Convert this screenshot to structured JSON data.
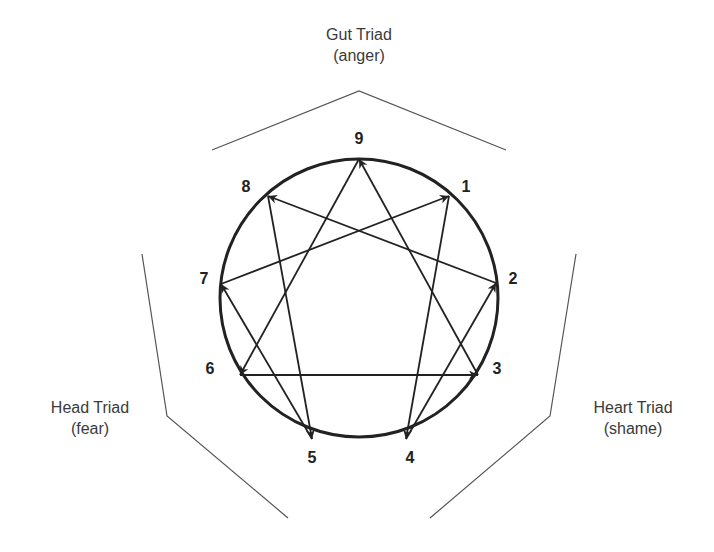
{
  "diagram": {
    "triads": [
      {
        "name": "Gut Triad",
        "emotion": "(anger)"
      },
      {
        "name": "Head Triad",
        "emotion": "(fear)"
      },
      {
        "name": "Heart Triad",
        "emotion": "(shame)"
      }
    ],
    "points": [
      "1",
      "2",
      "3",
      "4",
      "5",
      "6",
      "7",
      "8",
      "9"
    ],
    "arrows": [
      {
        "from": "9",
        "to": "6"
      },
      {
        "from": "6",
        "to": "3"
      },
      {
        "from": "3",
        "to": "9"
      },
      {
        "from": "1",
        "to": "4"
      },
      {
        "from": "4",
        "to": "2"
      },
      {
        "from": "2",
        "to": "8"
      },
      {
        "from": "8",
        "to": "5"
      },
      {
        "from": "5",
        "to": "7"
      },
      {
        "from": "7",
        "to": "1"
      }
    ],
    "colors": {
      "stroke": "#222222",
      "outline": "#555555",
      "text": "#3a3a3a"
    }
  }
}
